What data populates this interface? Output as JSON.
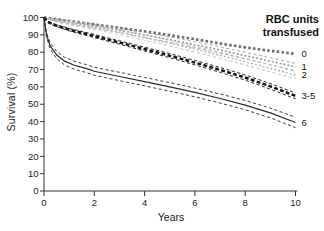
{
  "figure": {
    "ylabel": "Survival (%)",
    "xlabel": "Years",
    "legend_title_line1": "RBC units",
    "legend_title_line2": "transfused"
  },
  "chart_data": {
    "type": "line",
    "title": "",
    "xlabel": "Years",
    "ylabel": "Survival (%)",
    "xlim": [
      0,
      10
    ],
    "ylim": [
      0,
      100
    ],
    "x_ticks": [
      0,
      2,
      4,
      6,
      8,
      10
    ],
    "y_ticks": [
      0,
      10,
      20,
      30,
      40,
      50,
      60,
      70,
      80,
      90,
      100
    ],
    "grid": false,
    "legend_title": "RBC units transfused",
    "legend_position": "top-right",
    "note": "Kaplan-Meier style survival curves by number of RBC units transfused; dashed flanking lines are confidence intervals",
    "axis_color": "#333333",
    "label_color": "#111111",
    "series": [
      {
        "name": "0",
        "color": "#6f6f6f",
        "style": "dotted-bold",
        "points": [
          [
            0,
            100
          ],
          [
            0.5,
            99
          ],
          [
            1,
            98
          ],
          [
            2,
            96
          ],
          [
            3,
            94
          ],
          [
            4,
            92
          ],
          [
            5,
            89.8
          ],
          [
            6,
            87.5
          ],
          [
            7,
            85
          ],
          [
            8,
            82.8
          ],
          [
            9,
            80.8
          ],
          [
            10,
            79
          ]
        ]
      },
      {
        "name": "1",
        "color": "#9e9e9e",
        "style": "dotted",
        "points": [
          [
            0,
            100
          ],
          [
            0.5,
            98.5
          ],
          [
            1,
            97.3
          ],
          [
            2,
            95
          ],
          [
            3,
            92.6
          ],
          [
            4,
            90
          ],
          [
            5,
            87.2
          ],
          [
            6,
            84.3
          ],
          [
            7,
            81.3
          ],
          [
            8,
            78
          ],
          [
            9,
            74.8
          ],
          [
            10,
            71.5
          ]
        ],
        "ci_pct": [
          0,
          0.7,
          0.9,
          1.1,
          1.3,
          1.5,
          1.6,
          1.7,
          1.8,
          1.9,
          2.0,
          2.1
        ]
      },
      {
        "name": "2",
        "color": "#bcbcbc",
        "style": "dotted",
        "points": [
          [
            0,
            100
          ],
          [
            0.5,
            98
          ],
          [
            1,
            96.8
          ],
          [
            2,
            94.2
          ],
          [
            3,
            91.4
          ],
          [
            4,
            88.4
          ],
          [
            5,
            85.2
          ],
          [
            6,
            81.8
          ],
          [
            7,
            78.2
          ],
          [
            8,
            74.5
          ],
          [
            9,
            70.7
          ],
          [
            10,
            66.8
          ]
        ],
        "ci_pct": [
          0,
          0.7,
          0.9,
          1.1,
          1.3,
          1.5,
          1.6,
          1.7,
          1.8,
          1.9,
          2.0,
          2.1
        ]
      },
      {
        "name": "3-5",
        "color": "#141414",
        "style": "dashed-bold",
        "points": [
          [
            0,
            100
          ],
          [
            0.15,
            97.5
          ],
          [
            0.4,
            95.8
          ],
          [
            1,
            93
          ],
          [
            2,
            89.3
          ],
          [
            3,
            85.6
          ],
          [
            4,
            81.8
          ],
          [
            5,
            78
          ],
          [
            6,
            74
          ],
          [
            7,
            69.8
          ],
          [
            8,
            65.4
          ],
          [
            9,
            60.3
          ],
          [
            10,
            54.8
          ]
        ],
        "ci_pct": [
          0,
          0.3,
          0.5,
          0.7,
          0.9,
          1.0,
          1.1,
          1.2,
          1.3,
          1.4,
          1.5,
          1.6,
          1.7
        ]
      },
      {
        "name": "6",
        "color": "#2b2b2b",
        "style": "solid",
        "points": [
          [
            0,
            100
          ],
          [
            0.1,
            90
          ],
          [
            0.25,
            83.5
          ],
          [
            0.5,
            78.5
          ],
          [
            0.8,
            75
          ],
          [
            1.2,
            72.5
          ],
          [
            1.7,
            70.5
          ],
          [
            2,
            69
          ],
          [
            3,
            66
          ],
          [
            4,
            63
          ],
          [
            5,
            60
          ],
          [
            6,
            56.8
          ],
          [
            7,
            53.3
          ],
          [
            8,
            49.5
          ],
          [
            9,
            45
          ],
          [
            10,
            39.5
          ]
        ],
        "ci_pct": [
          0,
          1.2,
          1.8,
          2.1,
          2.2,
          2.3,
          2.3,
          2.3,
          2.4,
          2.4,
          2.5,
          2.5,
          2.6,
          2.7,
          2.8,
          3.0
        ]
      }
    ]
  }
}
